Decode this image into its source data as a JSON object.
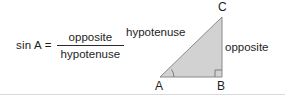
{
  "figure": {
    "background_color": "#ffffff",
    "text_color": "#1d1d1d"
  },
  "formula": {
    "lhs": "sin A =",
    "numerator": "opposite",
    "denominator": "hypotenuse"
  },
  "triangle": {
    "fill_color": "#d2d2d2",
    "stroke_color": "#8a8a8a",
    "vertices": {
      "A": {
        "label": "A",
        "x": 36,
        "y": 77
      },
      "B": {
        "label": "B",
        "x": 98,
        "y": 77
      },
      "C": {
        "label": "C",
        "x": 98,
        "y": 17
      }
    },
    "sides": {
      "hypotenuse": "hypotenuse",
      "opposite": "opposite"
    },
    "markers": {
      "right_angle_at": "B",
      "angle_arc_at": "A"
    }
  }
}
